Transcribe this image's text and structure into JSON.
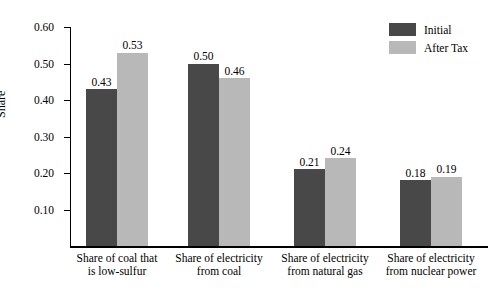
{
  "chart_data": {
    "type": "bar",
    "title": "",
    "xlabel": "",
    "ylabel": "Share",
    "ylim": [
      0.0,
      0.6
    ],
    "yticks": [
      "0.10",
      "0.20",
      "0.30",
      "0.40",
      "0.50",
      "0.60"
    ],
    "ytick_values": [
      0.1,
      0.2,
      0.3,
      0.4,
      0.5,
      0.6
    ],
    "grid": false,
    "legend_position": "top-right",
    "categories": [
      "Share of coal that is low-sulfur",
      "Share of electricity from coal",
      "Share of electricity from natural gas",
      "Share of electricity from nuclear power"
    ],
    "category_lines": [
      [
        "Share of coal that",
        "is low-sulfur"
      ],
      [
        "Share of electricity",
        "from coal"
      ],
      [
        "Share of electricity",
        "from natural gas"
      ],
      [
        "Share of electricity",
        "from nuclear power"
      ]
    ],
    "series": [
      {
        "name": "Initial",
        "color": "#484848",
        "values": [
          0.43,
          0.5,
          0.21,
          0.18
        ],
        "labels": [
          "0.43",
          "0.50",
          "0.21",
          "0.18"
        ]
      },
      {
        "name": "After Tax",
        "color": "#b8b8b8",
        "values": [
          0.53,
          0.46,
          0.24,
          0.19
        ],
        "labels": [
          "0.53",
          "0.46",
          "0.24",
          "0.19"
        ]
      }
    ]
  },
  "legend": {
    "items": [
      {
        "label": "Initial",
        "color": "#484848"
      },
      {
        "label": "After Tax",
        "color": "#b8b8b8"
      }
    ]
  }
}
